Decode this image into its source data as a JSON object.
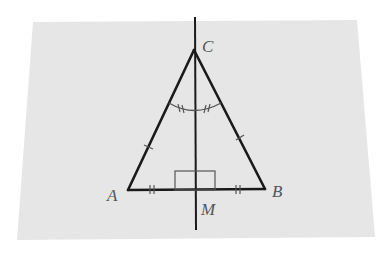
{
  "figure": {
    "type": "geometry-diagram",
    "colors": {
      "page_background": "#ffffff",
      "panel_background": "#e6e6e6",
      "stroke": "#1a1a1a",
      "label": "#555555"
    },
    "points": {
      "A": {
        "label": "A",
        "x": 128,
        "y": 190
      },
      "B": {
        "label": "B",
        "x": 265,
        "y": 189
      },
      "C": {
        "label": "C",
        "x": 194,
        "y": 50
      },
      "M": {
        "label": "M",
        "x": 195,
        "y": 190
      }
    },
    "labels": {
      "A": "A",
      "B": "B",
      "C": "C",
      "M": "M"
    },
    "markings": {
      "AC_BC_congruent": "single tick",
      "AM_MB_congruent": "double tick",
      "angle_ACM_BCM_congruent": "double-tick arcs",
      "right_angle_at_M": "square"
    }
  }
}
